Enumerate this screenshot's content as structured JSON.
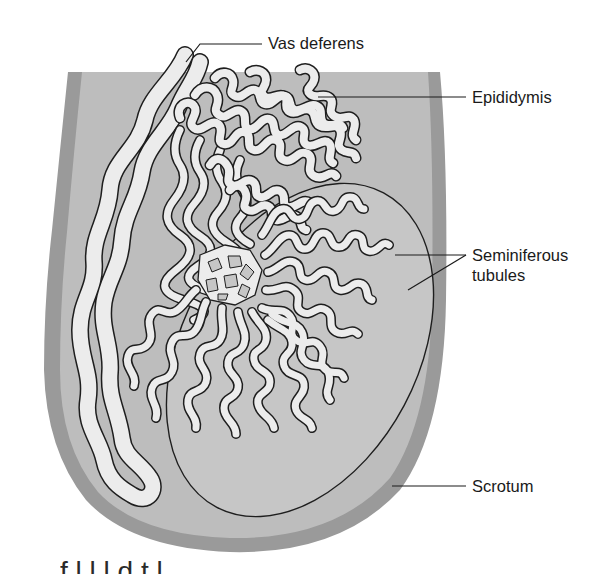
{
  "figure": {
    "colors": {
      "scrotum_outer": "#9a9a9a",
      "scrotum_inner": "#b9b9b9",
      "testis_fill": "#c4c4c4",
      "tubule_fill": "#ececec",
      "outline": "#1e1e1e",
      "background": "#ffffff"
    }
  },
  "labels": {
    "vas_deferens": "Vas deferens",
    "epididymis": "Epididymis",
    "seminiferous_line1": "Seminiferous",
    "seminiferous_line2": "tubules",
    "scrotum": "Scrotum"
  },
  "caption_fragment": "f         l  l        l d   t         l"
}
